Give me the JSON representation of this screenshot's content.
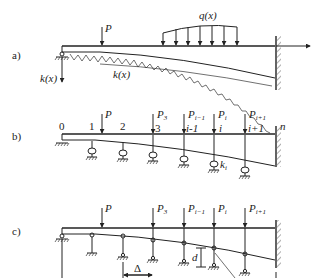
{
  "figure": {
    "panels": [
      {
        "id": "a",
        "label": "a)",
        "description": "Beam on elastic foundation with variable stiffness, point load and distributed load, fixed at right end",
        "labels": {
          "point_load": "P",
          "distributed_load": "q(x)",
          "foundation_left": "k(x)",
          "foundation_mid": "k(x)"
        }
      },
      {
        "id": "b",
        "label": "b)",
        "description": "Discretized beam supported by springs at nodes",
        "nodes": [
          "0",
          "1",
          "2",
          "3",
          "i-1",
          "i",
          "i+1",
          "n"
        ],
        "loads": [
          "P",
          "P3",
          "Pi-1",
          "Pi",
          "Pi+1"
        ],
        "spring_label": "ki"
      },
      {
        "id": "c",
        "label": "c)",
        "description": "Beam with rigid supports and gaps (settlements)",
        "loads": [
          "P",
          "P3",
          "Pi-1",
          "Pi",
          "Pi+1"
        ],
        "spacing_label": "Δ",
        "gap_label": "d"
      }
    ]
  }
}
